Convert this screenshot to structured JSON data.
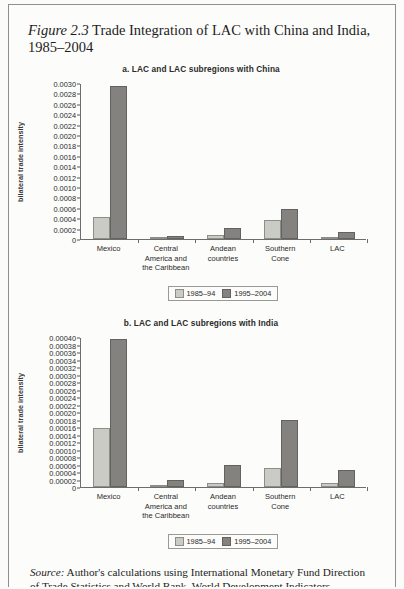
{
  "figure": {
    "label": "Figure 2.3",
    "title": "Trade Integration of LAC with China and India, 1985–2004"
  },
  "source": {
    "label": "Source:",
    "line1": "Author's calculations using International Monetary Fund Direction",
    "line2": "of Trade Statistics and World Bank, World Development Indicators."
  },
  "legend": {
    "series1": "1985–94",
    "series2": "1995–2004"
  },
  "colors": {
    "series1_fill": "#cbcbc6",
    "series1_stroke": "#8e8e88",
    "series2_fill": "#83827f",
    "series2_stroke": "#63625f",
    "axis": "#6d6d6d"
  },
  "chart_data": [
    {
      "type": "bar",
      "panel": "a",
      "title": "a. LAC and LAC subregions with China",
      "ylabel": "bilateral trade intensity",
      "xlabel": "",
      "categories": [
        "Mexico",
        "Central America and the Caribbean",
        "Andean countries",
        "Southern Cone",
        "LAC"
      ],
      "category_lines": [
        [
          "Mexico"
        ],
        [
          "Central",
          "America and",
          "the Caribbean"
        ],
        [
          "Andean",
          "countries"
        ],
        [
          "Southern",
          "Cone"
        ],
        [
          "LAC"
        ]
      ],
      "series": [
        {
          "name": "1985–94",
          "values": [
            0.00042,
            2e-05,
            8e-05,
            0.00037,
            4e-05
          ]
        },
        {
          "name": "1995–2004",
          "values": [
            0.00295,
            5e-05,
            0.00021,
            0.00058,
            0.00013
          ]
        }
      ],
      "ylim": [
        0,
        0.003
      ],
      "ytick_step": 0.0002,
      "ytick_labels": [
        "0.0030",
        "0.0028",
        "0.0026",
        "0.0024",
        "0.0022",
        "0.0020",
        "0.0018",
        "0.0016",
        "0.0014",
        "0.0012",
        "0.0010",
        "0.0008",
        "0.0006",
        "0.0004",
        "0.0002",
        "0"
      ],
      "grid": false,
      "legend_position": "bottom-center"
    },
    {
      "type": "bar",
      "panel": "b",
      "title": "b. LAC and LAC subregions with India",
      "ylabel": "bilateral trade intensity",
      "xlabel": "",
      "categories": [
        "Mexico",
        "Central America and the Caribbean",
        "Andean countries",
        "Southern Cone",
        "LAC"
      ],
      "category_lines": [
        [
          "Mexico"
        ],
        [
          "Central",
          "America and",
          "the Caribbean"
        ],
        [
          "Andean",
          "countries"
        ],
        [
          "Southern",
          "Cone"
        ],
        [
          "LAC"
        ]
      ],
      "series": [
        {
          "name": "1985–94",
          "values": [
            0.000158,
            4e-06,
            1e-05,
            5.2e-05,
            1.2e-05
          ]
        },
        {
          "name": "1995–2004",
          "values": [
            0.000395,
            1.8e-05,
            6e-05,
            0.00018,
            4.5e-05
          ]
        }
      ],
      "ylim": [
        0,
        0.0004
      ],
      "ytick_step": 2e-05,
      "ytick_labels": [
        "0.00040",
        "0.00038",
        "0.00036",
        "0.00034",
        "0.00032",
        "0.00030",
        "0.00028",
        "0.00026",
        "0.00024",
        "0.00022",
        "0.00020",
        "0.00018",
        "0.00016",
        "0.00014",
        "0.00012",
        "0.00010",
        "0.00008",
        "0.00006",
        "0.00004",
        "0.00002",
        "0"
      ],
      "grid": false,
      "legend_position": "bottom-center"
    }
  ]
}
